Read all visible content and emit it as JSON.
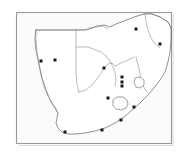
{
  "figure": {
    "type": "locality-distribution-map",
    "region_name": "Southern Africa",
    "background_color": "#ffffff",
    "frame": {
      "x": 16,
      "y": 12,
      "width": 156,
      "height": 132,
      "fill": "#fbfbfb",
      "stroke": "#9a9a9a"
    },
    "outline_color": "#6e6e6e",
    "border_color": "#8b8b8b"
  },
  "shaded_region": {
    "label": "shaded-distribution-area",
    "color": "#a8a8a8",
    "position": "northeast",
    "outline_color": "#555555"
  },
  "enclaves": [
    {
      "name": "lesotho-enclave",
      "cx": 120,
      "cy": 103
    },
    {
      "name": "swaziland-enclave",
      "cx": 139,
      "cy": 82
    }
  ],
  "locality_dots": [
    {
      "id": 1,
      "x": 41,
      "y": 61
    },
    {
      "id": 2,
      "x": 55,
      "y": 60
    },
    {
      "id": 3,
      "x": 104,
      "y": 68
    },
    {
      "id": 4,
      "x": 122,
      "y": 77
    },
    {
      "id": 5,
      "x": 122,
      "y": 82
    },
    {
      "id": 6,
      "x": 122,
      "y": 86
    },
    {
      "id": 7,
      "x": 108,
      "y": 98
    },
    {
      "id": 8,
      "x": 136,
      "y": 29
    },
    {
      "id": 9,
      "x": 160,
      "y": 44
    },
    {
      "id": 10,
      "x": 134,
      "y": 107
    },
    {
      "id": 11,
      "x": 121,
      "y": 120
    },
    {
      "id": 12,
      "x": 102,
      "y": 130
    },
    {
      "id": 13,
      "x": 65,
      "y": 132
    }
  ],
  "dot_style": {
    "color": "#1a1a1a",
    "shape": "square",
    "size": 3
  }
}
